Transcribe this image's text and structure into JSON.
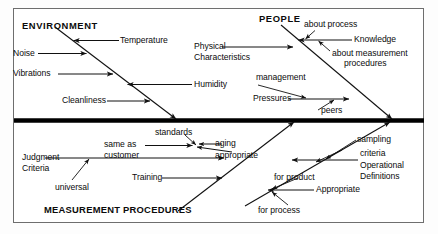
{
  "diagram": {
    "type": "fishbone-ishikawa",
    "spine": {
      "label": "",
      "orientation": "horizontal",
      "color": "#000000"
    },
    "categories": [
      {
        "id": "environment",
        "label": "ENVIRONMENT",
        "position": "upper-left",
        "causes": [
          {
            "label": "Temperature",
            "side": "right"
          },
          {
            "label": "Noise",
            "side": "left"
          },
          {
            "label": "Vibrations",
            "side": "left"
          },
          {
            "label": "Humidity",
            "side": "right"
          },
          {
            "label": "Cleanliness",
            "side": "left"
          }
        ]
      },
      {
        "id": "people",
        "label": "PEOPLE",
        "position": "upper-right",
        "causes": [
          {
            "label": "Knowledge",
            "side": "right",
            "sub": [
              {
                "label": "about process"
              },
              {
                "label": "about measurement"
              },
              {
                "label": "procedures"
              }
            ]
          },
          {
            "label": "Physical",
            "side": "left"
          },
          {
            "label": "Characteristics",
            "side": "left"
          },
          {
            "label": "Pressures",
            "side": "left",
            "sub": [
              {
                "label": "management"
              },
              {
                "label": "peers"
              }
            ]
          }
        ]
      },
      {
        "id": "measurement-procedures",
        "label": "MEASUREMENT  PROCEDURES",
        "position": "lower-left",
        "causes": [
          {
            "label": "Judgment",
            "side": "left",
            "sub": [
              {
                "label": "universal"
              }
            ]
          },
          {
            "label": "Criteria",
            "side": "left"
          },
          {
            "label": "same as",
            "side": "left"
          },
          {
            "label": "customer",
            "side": "left"
          },
          {
            "label": "standards",
            "side": "top"
          },
          {
            "label": "aging",
            "side": "right"
          },
          {
            "label": "appropriate",
            "side": "right"
          },
          {
            "label": "Training",
            "side": "left"
          }
        ]
      },
      {
        "id": "operational-definitions",
        "label": "Operational Definitions",
        "position": "lower-right",
        "causes": [
          {
            "label": "sampling",
            "side": "top"
          },
          {
            "label": "criteria",
            "side": "top"
          },
          {
            "label": "Operational",
            "side": "right"
          },
          {
            "label": "Definitions",
            "side": "right"
          },
          {
            "label": "Appropriate",
            "side": "right",
            "sub": [
              {
                "label": "for product"
              },
              {
                "label": "for process"
              }
            ]
          }
        ]
      }
    ]
  },
  "labels": {
    "environment": "ENVIRONMENT",
    "people": "PEOPLE",
    "measurement_procedures": "MEASUREMENT  PROCEDURES",
    "temperature": "Temperature",
    "noise": "Noise",
    "vibrations": "Vibrations",
    "humidity": "Humidity",
    "cleanliness": "Cleanliness",
    "about_process": "about process",
    "knowledge": "Knowledge",
    "about_measurement": "about measurement",
    "procedures": "procedures",
    "physical": "Physical",
    "characteristics": "Characteristics",
    "management": "management",
    "pressures": "Pressures",
    "peers": "peers",
    "standards": "standards",
    "same_as": "same as",
    "customer": "customer",
    "aging": "aging",
    "appropriate_sub": "appropriate",
    "judgment": "Judgment",
    "criteria_left": "Criteria",
    "universal": "universal",
    "training": "Training",
    "sampling": "sampling",
    "criteria_right": "criteria",
    "operational": "Operational",
    "definitions": "Definitions",
    "for_product": "for product",
    "appropriate": "Appropriate",
    "for_process": "for process"
  },
  "colors": {
    "spine": "#000000",
    "bone": "#1a1a1a",
    "text": "#0b0b0b",
    "frame": "#6e6e6e",
    "background": "#ffffff"
  }
}
